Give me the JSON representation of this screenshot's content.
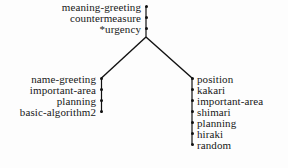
{
  "diagram": {
    "type": "tree",
    "title": "",
    "background_color": "#fdfdfd",
    "line_color": "#111111",
    "text_color": "#171717",
    "root_branch": {
      "name": "root-spine",
      "nodes": [
        {
          "label": "meaning-greeting"
        },
        {
          "label": "countermeasure"
        },
        {
          "label": "*urgency"
        }
      ]
    },
    "left_branch": {
      "name": "left-branch",
      "nodes": [
        {
          "label": "name-greeting"
        },
        {
          "label": "important-area"
        },
        {
          "label": "planning"
        },
        {
          "label": "basic-algorithm2"
        }
      ]
    },
    "right_branch": {
      "name": "right-branch",
      "nodes": [
        {
          "label": "position"
        },
        {
          "label": "kakari"
        },
        {
          "label": "important-area"
        },
        {
          "label": "shimari"
        },
        {
          "label": "planning"
        },
        {
          "label": "hiraki"
        },
        {
          "label": "random"
        }
      ]
    }
  }
}
